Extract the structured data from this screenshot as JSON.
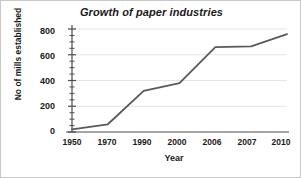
{
  "chart_data": {
    "type": "line",
    "title": "Growth of paper industries",
    "xlabel": "Year",
    "ylabel": "No of mills established",
    "categories": [
      "1950",
      "1970",
      "1990",
      "2000",
      "2006",
      "2007",
      "2010"
    ],
    "values": [
      20,
      60,
      320,
      380,
      660,
      665,
      760
    ],
    "series": [
      {
        "name": "No of mills established",
        "values": [
          20,
          60,
          320,
          380,
          660,
          665,
          760
        ]
      }
    ],
    "ylim": [
      0,
      800
    ],
    "yticks": [
      0,
      200,
      400,
      600,
      800
    ],
    "ytick_labels": [
      "0",
      "200",
      "400",
      "600",
      "800"
    ],
    "yminor_step": 50,
    "grid": "horizontal-major",
    "legend": "none",
    "line_color": "#595959",
    "grid_color": "#e4e4e4",
    "axis_color": "#4d4d4d",
    "background_color": "#ffffff",
    "text_color": "#1a1a1a"
  }
}
